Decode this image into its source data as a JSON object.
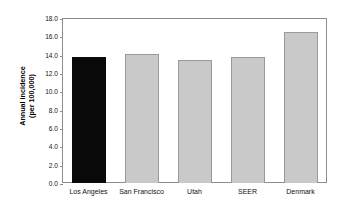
{
  "chart_data": {
    "type": "bar",
    "title": "",
    "xlabel": "",
    "ylabel": "Annual incidence (per 100,000)",
    "ylabel_line1": "Annual incidence",
    "ylabel_line2": "(per 100,000)",
    "categories": [
      "Los Angeles",
      "San Francisco",
      "Utah",
      "SEER",
      "Denmark"
    ],
    "values": [
      13.8,
      14.1,
      13.4,
      13.8,
      16.5
    ],
    "bar_colors": [
      "#090909",
      "#c9c9c9",
      "#c9c9c9",
      "#c9c9c9",
      "#c9c9c9"
    ],
    "ylim": [
      0.0,
      18.0
    ],
    "ytick_values": [
      0.0,
      2.0,
      4.0,
      6.0,
      8.0,
      10.0,
      12.0,
      14.0,
      16.0,
      18.0
    ],
    "ytick_labels": [
      "0.0",
      "2.0",
      "4.0",
      "6.0",
      "8.0",
      "10.0",
      "12.0",
      "14.0",
      "16.0",
      "18.0"
    ],
    "grid": false,
    "legend": null,
    "frame": true,
    "bar_border_color": "#9a9a9a",
    "axis_color": "#8d8d8d"
  }
}
